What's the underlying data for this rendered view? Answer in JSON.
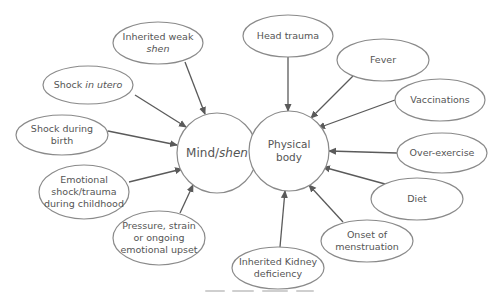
{
  "diagram": {
    "type": "causes-diagram",
    "centers": [
      {
        "id": "mind",
        "lines": [
          {
            "parts": [
              {
                "t": "Mind/",
                "i": false
              },
              {
                "t": "shen",
                "i": true
              }
            ]
          }
        ],
        "cx": 217,
        "cy": 153,
        "r": 40,
        "fs": 12
      },
      {
        "id": "body",
        "lines": [
          {
            "parts": [
              {
                "t": "Physical",
                "i": false
              }
            ]
          },
          {
            "parts": [
              {
                "t": "body",
                "i": false
              }
            ]
          }
        ],
        "cx": 289,
        "cy": 151,
        "r": 40,
        "fs": 10.5
      }
    ],
    "causes": [
      {
        "id": "inherited-weak-shen",
        "target": "mind",
        "cx": 158,
        "cy": 43,
        "rx": 45,
        "ry": 21,
        "lines": [
          {
            "parts": [
              {
                "t": "Inherited weak",
                "i": false
              }
            ]
          },
          {
            "parts": [
              {
                "t": "shen",
                "i": true
              }
            ]
          }
        ],
        "from": [
          185,
          62
        ],
        "to": [
          205,
          114
        ]
      },
      {
        "id": "shock-in-utero",
        "target": "mind",
        "cx": 88,
        "cy": 85,
        "rx": 45,
        "ry": 19,
        "lines": [
          {
            "parts": [
              {
                "t": "Shock ",
                "i": false
              },
              {
                "t": "in utero",
                "i": true
              }
            ]
          }
        ],
        "from": [
          135,
          95
        ],
        "to": [
          186,
          127
        ]
      },
      {
        "id": "shock-during-birth",
        "target": "mind",
        "cx": 62,
        "cy": 135,
        "rx": 46,
        "ry": 20,
        "lines": [
          {
            "parts": [
              {
                "t": "Shock during",
                "i": false
              }
            ]
          },
          {
            "parts": [
              {
                "t": "birth",
                "i": false
              }
            ]
          }
        ],
        "from": [
          108,
          131
        ],
        "to": [
          177,
          145
        ]
      },
      {
        "id": "emotional-shock-childhood",
        "target": "mind",
        "cx": 84,
        "cy": 192,
        "rx": 45,
        "ry": 27,
        "lines": [
          {
            "parts": [
              {
                "t": "Emotional",
                "i": false
              }
            ]
          },
          {
            "parts": [
              {
                "t": "shock/trauma",
                "i": false
              }
            ]
          },
          {
            "parts": [
              {
                "t": "during childhood",
                "i": false
              }
            ]
          }
        ],
        "from": [
          129,
          182
        ],
        "to": [
          182,
          169
        ]
      },
      {
        "id": "pressure-strain-upset",
        "target": "mind",
        "cx": 159,
        "cy": 238,
        "rx": 46,
        "ry": 27,
        "lines": [
          {
            "parts": [
              {
                "t": "Pressure, strain",
                "i": false
              }
            ]
          },
          {
            "parts": [
              {
                "t": "or ongoing",
                "i": false
              }
            ]
          },
          {
            "parts": [
              {
                "t": "emotional upset",
                "i": false
              }
            ]
          }
        ],
        "from": [
          180,
          213
        ],
        "to": [
          193,
          185
        ]
      },
      {
        "id": "head-trauma",
        "target": "body",
        "cx": 288,
        "cy": 36,
        "rx": 45,
        "ry": 21,
        "lines": [
          {
            "parts": [
              {
                "t": "Head trauma",
                "i": false
              }
            ]
          }
        ],
        "from": [
          288,
          57
        ],
        "to": [
          288,
          111
        ]
      },
      {
        "id": "fever",
        "target": "body",
        "cx": 383,
        "cy": 60,
        "rx": 46,
        "ry": 21,
        "lines": [
          {
            "parts": [
              {
                "t": "Fever",
                "i": false
              }
            ]
          }
        ],
        "from": [
          353,
          76
        ],
        "to": [
          311,
          118
        ]
      },
      {
        "id": "vaccinations",
        "target": "body",
        "cx": 440,
        "cy": 100,
        "rx": 45,
        "ry": 21,
        "lines": [
          {
            "parts": [
              {
                "t": "Vaccinations",
                "i": false
              }
            ]
          }
        ],
        "from": [
          395,
          100
        ],
        "to": [
          318,
          128
        ]
      },
      {
        "id": "over-exercise",
        "target": "body",
        "cx": 442,
        "cy": 153,
        "rx": 45,
        "ry": 20,
        "lines": [
          {
            "parts": [
              {
                "t": "Over-exercise",
                "i": false
              }
            ]
          }
        ],
        "from": [
          397,
          153
        ],
        "to": [
          329,
          151
        ]
      },
      {
        "id": "diet",
        "target": "body",
        "cx": 417,
        "cy": 199,
        "rx": 46,
        "ry": 21,
        "lines": [
          {
            "parts": [
              {
                "t": "Diet",
                "i": false
              }
            ]
          }
        ],
        "from": [
          385,
          184
        ],
        "to": [
          323,
          167
        ]
      },
      {
        "id": "onset-of-menstruation",
        "target": "body",
        "cx": 367,
        "cy": 241,
        "rx": 46,
        "ry": 21,
        "lines": [
          {
            "parts": [
              {
                "t": "Onset of",
                "i": false
              }
            ]
          },
          {
            "parts": [
              {
                "t": "menstruation",
                "i": false
              }
            ]
          }
        ],
        "from": [
          343,
          222
        ],
        "to": [
          309,
          185
        ]
      },
      {
        "id": "inherited-kidney-deficiency",
        "target": "body",
        "cx": 278,
        "cy": 268,
        "rx": 46,
        "ry": 21,
        "lines": [
          {
            "parts": [
              {
                "t": "Inherited Kidney",
                "i": false
              }
            ]
          },
          {
            "parts": [
              {
                "t": "deficiency",
                "i": false
              }
            ]
          }
        ],
        "from": [
          280,
          247
        ],
        "to": [
          285,
          191
        ]
      }
    ],
    "caption_visible_but_illegible": true
  },
  "colors": {
    "stroke": "#8a8a8a",
    "arrow": "#5a5a5a",
    "text": "#555555",
    "background": "#ffffff"
  }
}
